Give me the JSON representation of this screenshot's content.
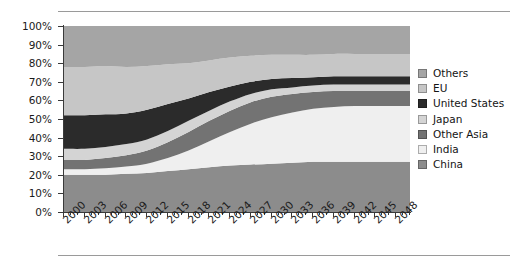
{
  "chart_data": {
    "type": "area",
    "stacked": true,
    "normalized": true,
    "title": "",
    "xlabel": "",
    "ylabel": "",
    "ylim": [
      0,
      100
    ],
    "ytick_labels": [
      "0%",
      "10%",
      "20%",
      "30%",
      "40%",
      "50%",
      "60%",
      "70%",
      "80%",
      "90%",
      "100%"
    ],
    "ytick_values": [
      0,
      10,
      20,
      30,
      40,
      50,
      60,
      70,
      80,
      90,
      100
    ],
    "grid": false,
    "legend_position": "right",
    "x": [
      2000,
      2003,
      2006,
      2009,
      2012,
      2015,
      2018,
      2021,
      2024,
      2027,
      2030,
      2033,
      2036,
      2039,
      2042,
      2045,
      2048,
      2050
    ],
    "xtick_labels": [
      "2000",
      "2003",
      "2006",
      "2009",
      "2012",
      "2015",
      "2018",
      "2021",
      "2024",
      "2027",
      "2030",
      "2033",
      "2036",
      "2039",
      "2042",
      "2045",
      "2048"
    ],
    "series": [
      {
        "name": "China",
        "color": "#8c8c8c",
        "stack_order": 1,
        "values": [
          20,
          20,
          20,
          20.5,
          21,
          22,
          23,
          24,
          25,
          25.5,
          26,
          26.5,
          27,
          27,
          27,
          27,
          27,
          27
        ]
      },
      {
        "name": "India",
        "color": "#efefef",
        "stack_order": 2,
        "values": [
          3,
          3,
          3.5,
          4,
          5,
          7,
          10,
          14,
          18,
          22,
          25,
          27,
          28.5,
          29.5,
          30,
          30,
          30,
          30
        ]
      },
      {
        "name": "Other Asia",
        "color": "#737373",
        "stack_order": 3,
        "values": [
          5,
          5,
          5.5,
          6,
          7,
          8.5,
          10,
          11,
          11.5,
          11.5,
          11,
          10,
          9,
          8.5,
          8,
          8,
          8,
          8
        ]
      },
      {
        "name": "Japan",
        "color": "#d4d4d4",
        "stack_order": 4,
        "values": [
          6,
          6,
          6,
          6,
          6,
          6,
          6,
          5.5,
          5,
          4.5,
          4,
          3.5,
          3.5,
          3.5,
          3.5,
          3.5,
          3.5,
          3.5
        ]
      },
      {
        "name": "United States",
        "color": "#2b2b2b",
        "stack_order": 5,
        "values": [
          18,
          18,
          17.5,
          16.5,
          16,
          14.5,
          12,
          10,
          8,
          6.5,
          5.5,
          5,
          4.5,
          4.5,
          4.5,
          4.5,
          4.5,
          4.5
        ]
      },
      {
        "name": "EU",
        "color": "#c6c6c6",
        "stack_order": 6,
        "values": [
          26,
          26,
          26,
          25,
          23.5,
          21.5,
          19,
          17,
          15.5,
          14,
          13,
          12.5,
          12,
          12,
          12,
          12,
          12,
          12
        ]
      },
      {
        "name": "Others",
        "color": "#a5a5a5",
        "stack_order": 7,
        "values": [
          22,
          22,
          21.5,
          22,
          21.5,
          20.5,
          20,
          18.5,
          17,
          16,
          15.5,
          15.5,
          15.5,
          15,
          15,
          15,
          15,
          15
        ]
      }
    ]
  },
  "legend": {
    "items": [
      {
        "label": "Others",
        "color": "#a5a5a5"
      },
      {
        "label": "EU",
        "color": "#c6c6c6"
      },
      {
        "label": "United States",
        "color": "#2b2b2b"
      },
      {
        "label": "Japan",
        "color": "#d4d4d4"
      },
      {
        "label": "Other Asia",
        "color": "#737373"
      },
      {
        "label": "India",
        "color": "#efefef"
      },
      {
        "label": "China",
        "color": "#8c8c8c"
      }
    ]
  }
}
